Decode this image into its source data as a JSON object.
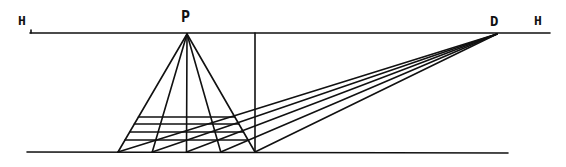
{
  "diagram": {
    "labels": {
      "horizon_left": "H",
      "horizon_right": "H",
      "vanishing_point": "P",
      "distance_point": "D"
    },
    "ground_points_count": 5,
    "transversal_count": 4,
    "ink_color": "#111111",
    "background": "#ffffff"
  }
}
